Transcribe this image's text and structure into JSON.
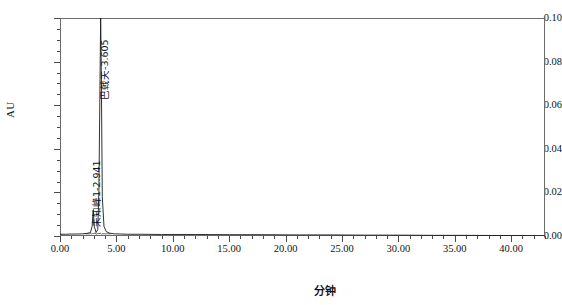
{
  "chart_data": {
    "type": "line",
    "title": "",
    "subtitle": "",
    "xlabel": "分钟",
    "ylabel": "AU",
    "xlim": [
      0.0,
      43.0
    ],
    "ylim": [
      0.0,
      0.1
    ],
    "grid": false,
    "legend_position": "none",
    "x_ticks": [
      "0.00",
      "5.00",
      "10.00",
      "15.00",
      "20.00",
      "25.00",
      "30.00",
      "35.00",
      "40.00"
    ],
    "x_tick_values": [
      0.0,
      5.0,
      10.0,
      15.0,
      20.0,
      25.0,
      30.0,
      35.0,
      40.0
    ],
    "x_minor_step": 1.0,
    "y_ticks": [
      "0.00",
      "0.02",
      "0.04",
      "0.06",
      "0.08",
      "0.10"
    ],
    "y_tick_values": [
      0.0,
      0.02,
      0.04,
      0.06,
      0.08,
      0.1
    ],
    "y_minor_step": 0.005,
    "series": [
      {
        "name": "chromatogram",
        "color": "#1a1a1a",
        "x": [
          0.0,
          0.5,
          1.0,
          1.5,
          2.0,
          2.4,
          2.7,
          2.85,
          2.941,
          3.05,
          3.2,
          3.35,
          3.45,
          3.55,
          3.605,
          3.66,
          3.75,
          3.9,
          4.1,
          4.4,
          4.8,
          5.4,
          6.0,
          7.0,
          9.0,
          12.0,
          15.0,
          18.0,
          21.0,
          24.0,
          27.0,
          30.0,
          33.0,
          36.0,
          39.0,
          41.0,
          43.0
        ],
        "y": [
          0.0008,
          0.0008,
          0.0009,
          0.0009,
          0.001,
          0.0012,
          0.0016,
          0.0045,
          0.0118,
          0.0042,
          0.0016,
          0.003,
          0.021,
          0.072,
          0.1,
          0.076,
          0.018,
          0.0044,
          0.002,
          0.0013,
          0.001,
          0.0009,
          0.0008,
          0.0008,
          0.0007,
          0.0007,
          0.0006,
          0.0006,
          0.0005,
          0.0005,
          0.0004,
          0.0004,
          0.0003,
          0.0003,
          0.0002,
          0.0002,
          0.0001
        ]
      }
    ],
    "annotations": [
      {
        "id": "peak-unknown-1",
        "label": "未知峰1-2.941",
        "retention_time": 2.941,
        "orientation": "vertical"
      },
      {
        "id": "peak-bajitian",
        "label": "巴戟天-3.605",
        "retention_time": 3.605,
        "orientation": "vertical"
      }
    ]
  }
}
